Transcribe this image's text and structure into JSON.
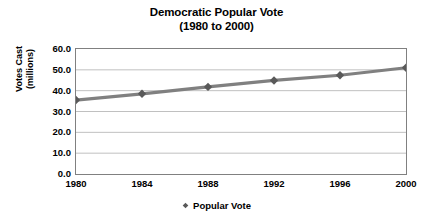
{
  "chart_data": {
    "type": "line",
    "title": "Democratic Popular Vote",
    "subtitle": "(1980 to 2000)",
    "xlabel": "",
    "ylabel_line1": "Votes Cast",
    "ylabel_line2": "(millions)",
    "categories": [
      "1980",
      "1984",
      "1988",
      "1992",
      "1996",
      "2000"
    ],
    "x": [
      1980,
      1984,
      1988,
      1992,
      1996,
      2000
    ],
    "series": [
      {
        "name": "Popular Vote",
        "values": [
          35.5,
          38.5,
          41.8,
          44.9,
          47.4,
          51.0
        ]
      }
    ],
    "ylim": [
      0.0,
      60.0
    ],
    "ytick_labels": [
      "60.0",
      "50.0",
      "40.0",
      "30.0",
      "20.0",
      "10.0",
      "0.0"
    ],
    "ytick_values": [
      60.0,
      50.0,
      40.0,
      30.0,
      20.0,
      10.0,
      0.0
    ],
    "grid": true,
    "grid_axis": "y",
    "legend_position": "bottom",
    "legend_entries": [
      "Popular Vote"
    ],
    "marker": "diamond",
    "series_color": "#808080",
    "marker_color": "#595959",
    "grid_color": "#c0c0c0",
    "frame_color": "#808080",
    "background": "#ffffff"
  },
  "legend": {
    "marker_icon": "diamond-marker-icon",
    "label": "Popular Vote"
  }
}
